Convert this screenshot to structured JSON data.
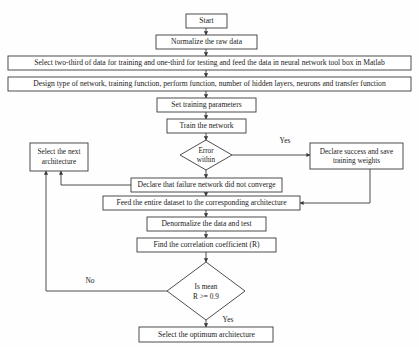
{
  "diagram": {
    "background_color": "#fefefe",
    "line_color": "#3a3a3a",
    "text_color": "#1a1a1a"
  },
  "nodes": {
    "start": {
      "label": "Start",
      "shape": "rect"
    },
    "normalize": {
      "label": "Normalize the raw data",
      "shape": "rect"
    },
    "select_data": {
      "label": "Select two-third of data for training and one-third for testing and feed the data in neural network tool box in Matlab",
      "shape": "rect"
    },
    "design_network": {
      "label": "Design type of network, training function, perform function, number of hidden layers, neurons and transfer function",
      "shape": "rect"
    },
    "set_params": {
      "label": "Set training parameters",
      "shape": "rect"
    },
    "train": {
      "label": "Train the network",
      "shape": "rect"
    },
    "error_within": {
      "label_line1": "Error",
      "label_line2": "within",
      "shape": "diamond"
    },
    "select_next": {
      "label_line1": "Select the next",
      "label_line2": "architecture",
      "shape": "rect"
    },
    "declare_success": {
      "label_line1": "Declare success and save",
      "label_line2": "training weights",
      "shape": "rect"
    },
    "declare_failure": {
      "label": "Declare that failure network did not converge",
      "shape": "rect"
    },
    "feed_dataset": {
      "label": "Feed the entire dataset to the corresponding architecture",
      "shape": "rect"
    },
    "denormalize": {
      "label": "Denormalize the data and test",
      "shape": "rect"
    },
    "find_corr": {
      "label": "Find the correlation coefficient (R)",
      "shape": "rect"
    },
    "is_mean": {
      "label_line1": "Is mean",
      "label_line2": "R >= 0.9",
      "shape": "diamond"
    },
    "select_optimum": {
      "label": "Select the optimum architecture",
      "shape": "rect"
    }
  },
  "edge_labels": {
    "error_yes": "Yes",
    "mean_no": "No",
    "mean_yes": "Yes"
  }
}
